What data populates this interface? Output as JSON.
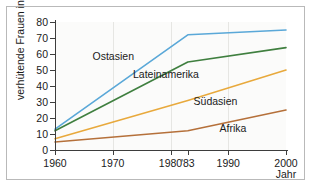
{
  "chart_data": {
    "type": "line",
    "title": "",
    "xlabel": "Jahr",
    "ylabel": "verhütende Frauen in %",
    "xlim": [
      1960,
      2000
    ],
    "ylim": [
      0,
      80
    ],
    "xticks": [
      1960,
      1970,
      1980,
      1983,
      1990,
      2000
    ],
    "xtick_labels": [
      "1960",
      "1970",
      "1980",
      "'83",
      "1990",
      "2000"
    ],
    "yticks": [
      0,
      10,
      20,
      30,
      40,
      50,
      60,
      70,
      80
    ],
    "ytick_labels": [
      "0",
      "10",
      "20",
      "30",
      "40",
      "50",
      "60",
      "70",
      "80"
    ],
    "grid": "vertical",
    "legend_position": "inline-labels",
    "series": [
      {
        "name": "Ostasien",
        "color": "#5aa8d8",
        "label_x": 1966.5,
        "label_y": 58,
        "x": [
          1960,
          1983,
          2000
        ],
        "values": [
          13,
          72,
          75
        ]
      },
      {
        "name": "Lateinamerika",
        "color": "#3f7f3f",
        "label_x": 1973.5,
        "label_y": 47,
        "x": [
          1960,
          1983,
          2000
        ],
        "values": [
          12,
          55,
          64
        ]
      },
      {
        "name": "Südasien",
        "color": "#e8a93c",
        "label_x": 1984.0,
        "label_y": 30,
        "x": [
          1960,
          1983,
          2000
        ],
        "values": [
          7,
          31,
          50
        ]
      },
      {
        "name": "Afrika",
        "color": "#b5703a",
        "label_x": 1988.5,
        "label_y": 13,
        "x": [
          1960,
          1983,
          2000
        ],
        "values": [
          5,
          12,
          25
        ]
      }
    ]
  }
}
